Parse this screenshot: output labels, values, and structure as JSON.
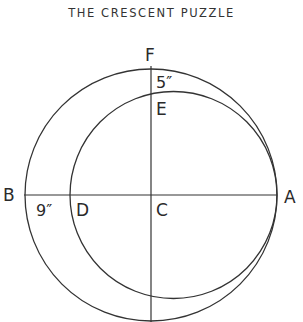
{
  "title": "THE CRESCENT PUZZLE",
  "labels": {
    "F": "F",
    "E": "E",
    "B": "B",
    "D": "D",
    "C": "C",
    "A": "A",
    "fe_measure": "5″",
    "bd_measure": "9″"
  },
  "geometry": {
    "outer_circle": {
      "cx": 151,
      "cy": 195,
      "r": 126
    },
    "inner_circle": {
      "cx": 173.5,
      "cy": 195,
      "r": 103.5
    },
    "stroke_color": "#333333"
  }
}
